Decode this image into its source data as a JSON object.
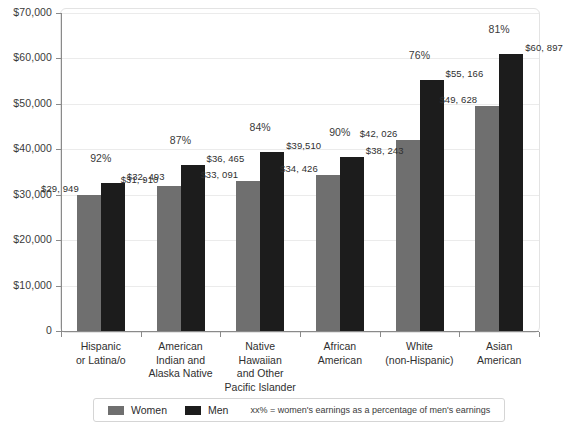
{
  "chart_data": {
    "type": "bar",
    "title": "",
    "subtitle": "",
    "xlabel": "",
    "ylabel": "",
    "ylim": [
      0,
      70000
    ],
    "grid": true,
    "legend_position": "bottom",
    "categories": [
      "Hispanic\nor Latina/o",
      "American\nIndian and\nAlaska Native",
      "Native\nHawaiian\nand Other\nPacific Islander",
      "African\nAmerican",
      "White\n(non-Hispanic)",
      "Asian\nAmerican"
    ],
    "series": [
      {
        "name": "Women",
        "color": "#6f6f6f",
        "values": [
          29949,
          31910,
          33091,
          34426,
          42026,
          49628
        ],
        "labels": [
          "$29, 949",
          "$31, 910",
          "$33, 091",
          "$34, 426",
          "$42, 026",
          "$49, 628"
        ]
      },
      {
        "name": "Men",
        "color": "#1c1c1c",
        "values": [
          32493,
          36465,
          39510,
          38243,
          55166,
          60897
        ],
        "labels": [
          "$32, 493",
          "$36, 465",
          "$39,510",
          "$38, 243",
          "$55, 166",
          "$60, 897"
        ]
      }
    ],
    "annotations": {
      "ratio_labels": [
        "92%",
        "87%",
        "84%",
        "90%",
        "76%",
        "81%"
      ],
      "ratio_values": [
        92,
        87,
        84,
        90,
        76,
        81
      ]
    },
    "y_ticks": [
      {
        "value": 70000,
        "label": "$70,000"
      },
      {
        "value": 60000,
        "label": "$60,000"
      },
      {
        "value": 50000,
        "label": "$50,000"
      },
      {
        "value": 40000,
        "label": "$40,000"
      },
      {
        "value": 30000,
        "label": "$30,000"
      },
      {
        "value": 20000,
        "label": "$20,000"
      },
      {
        "value": 10000,
        "label": "$10,000"
      },
      {
        "value": 0,
        "label": "0"
      }
    ]
  },
  "legend": {
    "items": [
      {
        "label": "Women",
        "color": "#6f6f6f"
      },
      {
        "label": "Men",
        "color": "#1c1c1c"
      }
    ],
    "note": "xx% = women's earnings as a percentage of men's earnings"
  },
  "colors": {
    "women_bar": "#6f6f6f",
    "men_bar": "#1c1c1c",
    "axis": "#8a8a8a",
    "gridline": "#ebebeb",
    "text": "#2f2f2f",
    "frame": "#e3e3e3"
  }
}
